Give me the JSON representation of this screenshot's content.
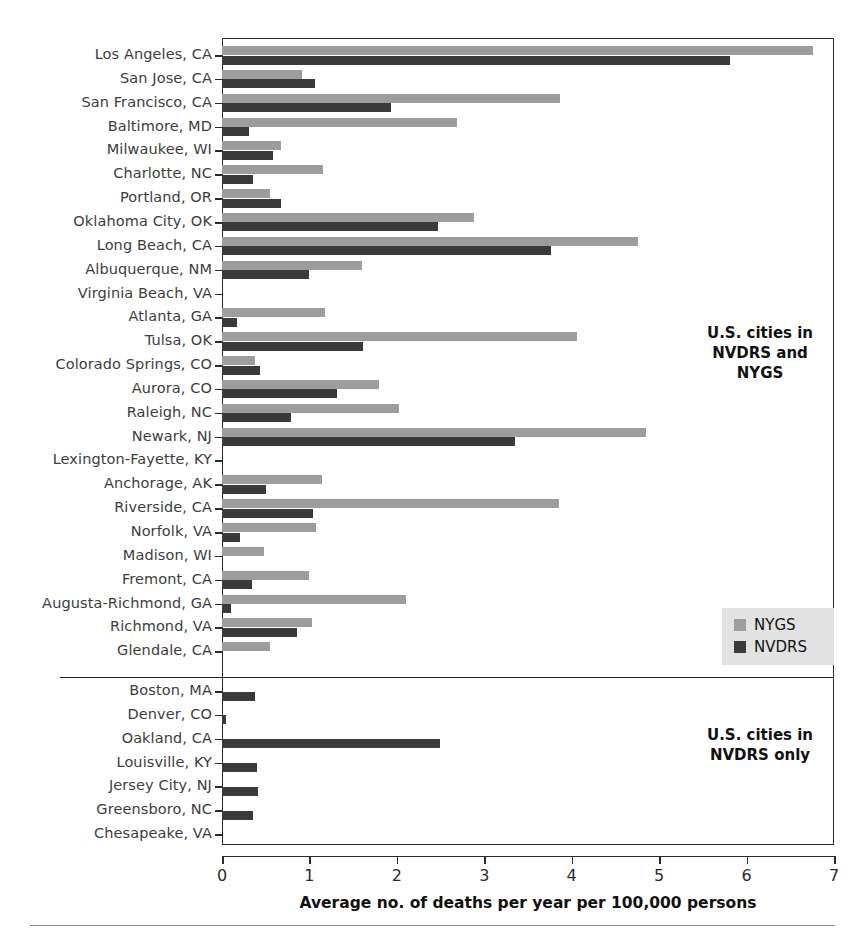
{
  "figure": {
    "background_color": "#ffffff",
    "frame_color": "#2b2b2b"
  },
  "axis": {
    "title": "Average no. of deaths per year per 100,000 persons",
    "ticks": [
      "0",
      "1",
      "2",
      "3",
      "4",
      "5",
      "6",
      "7"
    ]
  },
  "legend": {
    "entries": [
      {
        "label": "NYGS",
        "color": "#9d9d9d"
      },
      {
        "label": "NVDRS",
        "color": "#3a3a3a"
      }
    ],
    "background_color": "#e2e2e2"
  },
  "annotations": {
    "both": "U.S. cities in\nNVDRS and\nNYGS",
    "nvdrs_only": "U.S. cities in\nNVDRS only"
  },
  "chart_data": {
    "type": "bar",
    "orientation": "horizontal",
    "title": "",
    "xlabel": "Average no. of deaths per year per 100,000 persons",
    "ylabel": "",
    "xlim": [
      0,
      7
    ],
    "grid": false,
    "legend_position": "middle-right",
    "series": [
      {
        "name": "NYGS",
        "color": "#9d9d9d",
        "values": [
          6.76,
          0.92,
          3.87,
          2.69,
          0.67,
          1.16,
          0.55,
          2.88,
          4.76,
          1.6,
          0,
          1.18,
          4.06,
          0.38,
          1.8,
          2.03,
          4.85,
          0,
          1.14,
          3.85,
          1.08,
          0.48,
          0.99,
          2.11,
          1.03,
          0.55,
          0,
          0,
          0,
          0,
          0,
          0,
          0
        ]
      },
      {
        "name": "NVDRS",
        "color": "#3a3a3a",
        "values": [
          5.81,
          1.06,
          1.93,
          0.31,
          0.58,
          0.35,
          0.67,
          2.47,
          3.76,
          1.0,
          0,
          0.17,
          1.61,
          0.43,
          1.31,
          0.79,
          3.35,
          0,
          0.5,
          1.04,
          0.21,
          0,
          0.34,
          0.1,
          0.86,
          0,
          0.38,
          0.05,
          2.49,
          0.4,
          0.41,
          0.36,
          0
        ]
      }
    ],
    "categories": [
      "Los Angeles, CA",
      "San Jose, CA",
      "San Francisco, CA",
      "Baltimore, MD",
      "Milwaukee, WI",
      "Charlotte, NC",
      "Portland, OR",
      "Oklahoma City, OK",
      "Long Beach, CA",
      "Albuquerque, NM",
      "Virginia Beach, VA",
      "Atlanta, GA",
      "Tulsa, OK",
      "Colorado Springs, CO",
      "Aurora, CO",
      "Raleigh, NC",
      "Newark, NJ",
      "Lexington-Fayette, KY",
      "Anchorage, AK",
      "Riverside, CA",
      "Norfolk, VA",
      "Madison, WI",
      "Fremont, CA",
      "Augusta-Richmond, GA",
      "Richmond, VA",
      "Glendale, CA",
      "Boston, MA",
      "Denver, CO",
      "Oakland, CA",
      "Louisville, KY",
      "Jersey City, NJ",
      "Greensboro, NC",
      "Chesapeake, VA"
    ],
    "groups": [
      {
        "name": "U.S. cities in NVDRS and NYGS",
        "start_index": 0,
        "end_index": 25
      },
      {
        "name": "U.S. cities in NVDRS only",
        "start_index": 26,
        "end_index": 32
      }
    ]
  }
}
